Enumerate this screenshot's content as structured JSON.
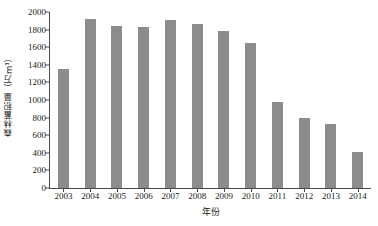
{
  "chart_data": {
    "type": "bar",
    "title": "",
    "xlabel": "年份",
    "ylabel": "森林蓄积量（万m³）",
    "categories": [
      "2003",
      "2004",
      "2005",
      "2006",
      "2007",
      "2008",
      "2009",
      "2010",
      "2011",
      "2012",
      "2013",
      "2014"
    ],
    "values": [
      1350,
      1920,
      1845,
      1835,
      1910,
      1860,
      1785,
      1650,
      980,
      790,
      730,
      410
    ],
    "series": [
      {
        "name": "森林蓄积量",
        "values": [
          1350,
          1920,
          1845,
          1835,
          1910,
          1860,
          1785,
          1650,
          980,
          790,
          730,
          410
        ]
      }
    ],
    "ylim": [
      0,
      2000
    ],
    "ytick_values": [
      0,
      200,
      400,
      600,
      800,
      1000,
      1200,
      1400,
      1600,
      1800,
      2000
    ],
    "ytick_labels": [
      "0",
      "200",
      "400",
      "600",
      "800",
      "1000",
      "1200",
      "1400",
      "1600",
      "1800",
      "2000"
    ],
    "grid": false,
    "legend": false,
    "legend_position": "none",
    "bar_color": "#8c8c8c",
    "axis_color": "#4a4a4a",
    "background_color": "#ffffff"
  }
}
